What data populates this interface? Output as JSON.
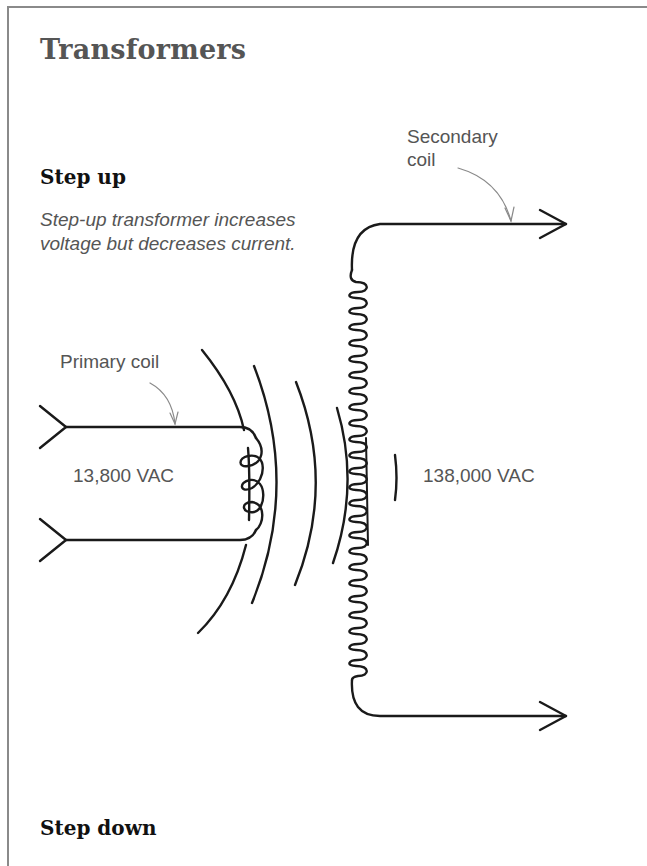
{
  "page": {
    "title": "Transformers"
  },
  "step_up": {
    "heading": "Step up",
    "description": "Step-up transformer increases voltage but decreases current."
  },
  "step_down": {
    "heading": "Step down"
  },
  "diagram": {
    "secondary_coil_label": "Secondary coil",
    "primary_coil_label": "Primary coil",
    "primary_voltage": "13,800 VAC",
    "secondary_voltage": "138,000 VAC",
    "stroke_color": "#1a1a1a",
    "leader_color": "#8a8a8a",
    "text_color": "#555555"
  }
}
